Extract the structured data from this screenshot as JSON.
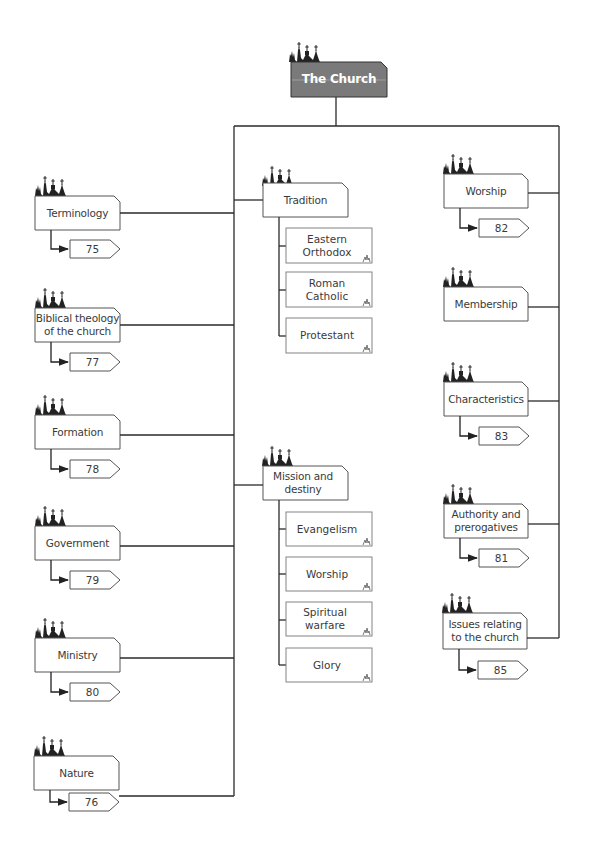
{
  "root": {
    "label": "The Church"
  },
  "left_column": [
    {
      "label": "Terminology",
      "page": "75"
    },
    {
      "label": "Biblical theology of the church",
      "page": "77"
    },
    {
      "label": "Formation",
      "page": "78"
    },
    {
      "label": "Government",
      "page": "79"
    },
    {
      "label": "Ministry",
      "page": "80"
    },
    {
      "label": "Nature",
      "page": "76"
    }
  ],
  "middle_column": [
    {
      "label": "Tradition",
      "children": [
        {
          "label": "Eastern Orthodox"
        },
        {
          "label": "Roman Catholic"
        },
        {
          "label": "Protestant"
        }
      ]
    },
    {
      "label": "Mission and destiny",
      "children": [
        {
          "label": "Evangelism"
        },
        {
          "label": "Worship"
        },
        {
          "label": "Spiritual warfare"
        },
        {
          "label": "Glory"
        }
      ]
    }
  ],
  "right_column": [
    {
      "label": "Worship",
      "page": "82"
    },
    {
      "label": "Membership",
      "page": null
    },
    {
      "label": "Characteristics",
      "page": "83"
    },
    {
      "label": "Authority and prerogatives",
      "page": "81"
    },
    {
      "label": "Issues relating to the church",
      "page": "85"
    }
  ],
  "colors": {
    "line": "#2a2a2a",
    "root_fill": "#7a7a7a",
    "box_stroke": "#555555",
    "sub_stroke": "#777777"
  },
  "icons": {
    "node_icon": "church-silhouette-icon",
    "sub_icon": "church-mini-icon",
    "page_tag": "arrow-tag-icon"
  }
}
